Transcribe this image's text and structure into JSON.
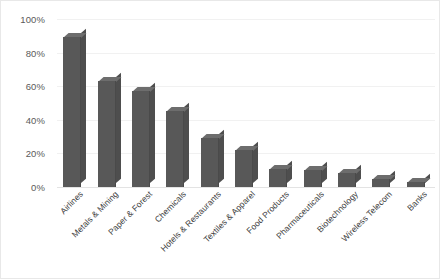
{
  "chart_data": {
    "type": "bar",
    "title": "",
    "xlabel": "",
    "ylabel": "",
    "ylim": [
      0,
      100
    ],
    "y_unit": "%",
    "grid": true,
    "legend": "none",
    "style": "3d-column",
    "bar_color": "#585858",
    "bar_top_color": "#6d6d6d",
    "bar_side_color": "#4e4e4e",
    "gridline_color": "#f1f1f1",
    "background": "#ffffff",
    "y_ticks": [
      "0%",
      "20%",
      "40%",
      "60%",
      "80%",
      "100%"
    ],
    "y_tick_values": [
      0,
      20,
      40,
      60,
      80,
      100
    ],
    "categories": [
      "Airlines",
      "Metals & Mining",
      "Paper & Forest",
      "Chemicals",
      "Hotels & Restaurants",
      "Textiles & Apparel",
      "Food Products",
      "Pharmaceuticals",
      "Biotechnology",
      "Wireless Telecom",
      "Banks"
    ],
    "values": [
      89,
      63,
      57,
      45,
      29,
      22,
      11,
      10,
      8.5,
      5,
      3
    ]
  }
}
